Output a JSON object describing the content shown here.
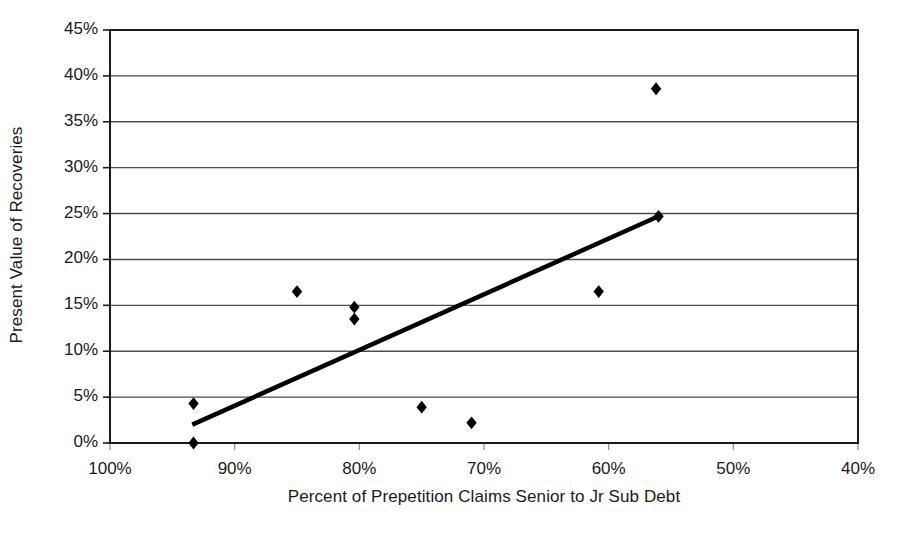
{
  "chart_data": {
    "type": "scatter",
    "title": "",
    "xlabel": "Percent of Prepetition Claims Senior to Jr Sub Debt",
    "ylabel": "Present Value of Recoveries",
    "xlim": [
      100,
      40
    ],
    "ylim": [
      0,
      45
    ],
    "x_reversed": true,
    "grid": "horizontal",
    "legend": "none",
    "xticks": [
      "100%",
      "90%",
      "80%",
      "70%",
      "60%",
      "50%",
      "40%"
    ],
    "xtick_values": [
      100,
      90,
      80,
      70,
      60,
      50,
      40
    ],
    "yticks": [
      "0%",
      "5%",
      "10%",
      "15%",
      "20%",
      "25%",
      "30%",
      "35%",
      "40%",
      "45%"
    ],
    "ytick_values": [
      0,
      5,
      10,
      15,
      20,
      25,
      30,
      35,
      40,
      45
    ],
    "series": [
      {
        "name": "Observations",
        "marker": "diamond",
        "color": "#000000",
        "points": [
          {
            "x": 93.3,
            "y": 0.0
          },
          {
            "x": 93.3,
            "y": 4.3
          },
          {
            "x": 85.0,
            "y": 16.5
          },
          {
            "x": 80.4,
            "y": 14.8
          },
          {
            "x": 80.4,
            "y": 13.5
          },
          {
            "x": 75.0,
            "y": 3.9
          },
          {
            "x": 71.0,
            "y": 2.2
          },
          {
            "x": 60.8,
            "y": 16.5
          },
          {
            "x": 56.2,
            "y": 38.6
          },
          {
            "x": 56.0,
            "y": 24.7
          }
        ]
      },
      {
        "name": "Trend line",
        "type": "line",
        "color": "#000000",
        "points": [
          {
            "x": 93.4,
            "y": 2.0
          },
          {
            "x": 56.0,
            "y": 24.7
          }
        ]
      }
    ]
  },
  "axes": {
    "x_title": "Percent of Prepetition Claims Senior to Jr Sub Debt",
    "y_title": "Present Value of Recoveries"
  },
  "style": {
    "frame_color": "#1a1a1a",
    "grid_color": "#4d4d4d",
    "marker_color": "#000000",
    "trend_color": "#000000",
    "background": "#ffffff"
  }
}
